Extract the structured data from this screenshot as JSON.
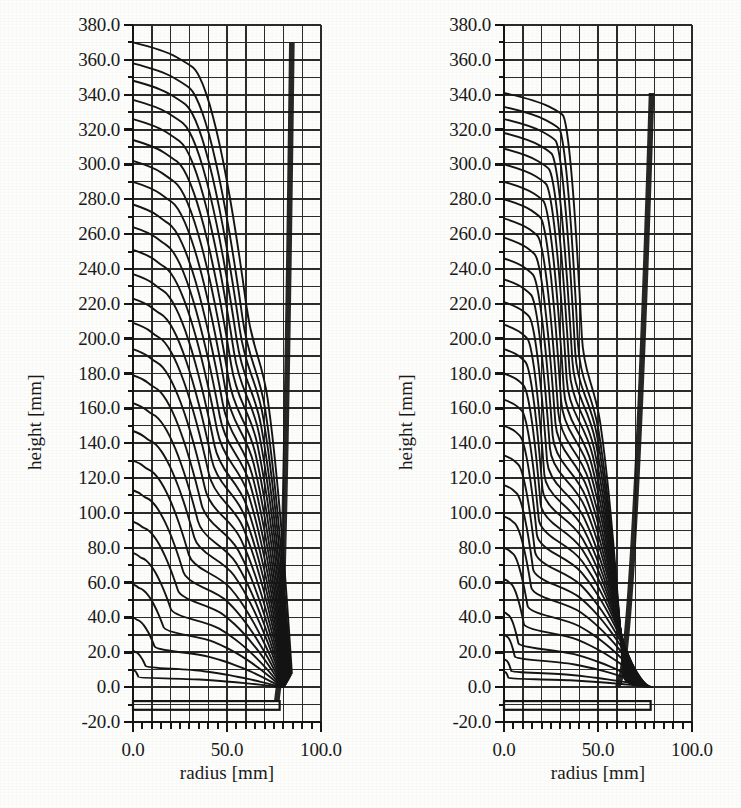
{
  "figure": {
    "background_color": "#fdfdfc",
    "ink_color": "#151515",
    "grid_color": "#2b2b2b",
    "panel_count": 2
  },
  "chart_data": [
    {
      "type": "line",
      "panel": "left",
      "title": "",
      "xlabel": "radius [mm]",
      "ylabel": "height [mm]",
      "xlim": [
        0.0,
        100.0
      ],
      "ylim": [
        -20.0,
        380.0
      ],
      "grid": true,
      "legend": "none",
      "x_major_ticks": [
        0.0,
        50.0,
        100.0
      ],
      "x_major_tick_labels": [
        "0.0",
        "50.0",
        "100.0"
      ],
      "x_minor_tick_step": 5.0,
      "x_grid_step": 10.0,
      "y_major_ticks": [
        -20.0,
        0.0,
        20.0,
        40.0,
        60.0,
        80.0,
        100.0,
        120.0,
        140.0,
        160.0,
        180.0,
        200.0,
        220.0,
        240.0,
        260.0,
        280.0,
        300.0,
        320.0,
        340.0,
        360.0,
        380.0
      ],
      "y_major_tick_labels": [
        "-20.0",
        "0.0",
        "20.0",
        "40.0",
        "60.0",
        "80.0",
        "100.0",
        "120.0",
        "140.0",
        "160.0",
        "180.0",
        "200.0",
        "220.0",
        "240.0",
        "260.0",
        "280.0",
        "300.0",
        "320.0",
        "340.0",
        "360.0",
        "380.0"
      ],
      "y_minor_tick_step": 10.0,
      "y_grid_step": 10.0,
      "description": "Axisymmetric FEM mesh of a deep-drawn cup: nested material flow lines rising from the blank at height -13 mm up to a drawn height of about 370 mm, all converging into a dark wall band near radius 78-85 mm.",
      "blank_outline": {
        "r0": 0.0,
        "r1": 78.0,
        "y_top": -8.0,
        "y_bottom": -13.0
      },
      "wall_band": {
        "r_inner": 78.0,
        "r_outer": 86.0,
        "y_bottom": -8.0,
        "y_top": 300.0
      },
      "series": [
        {
          "name": "flowline-01",
          "apex_height": 370.0,
          "flat_radius": 30.0,
          "knee_radius": 62.0,
          "wall_radius": 84.5,
          "base_height": 8.0
        },
        {
          "name": "flowline-02",
          "apex_height": 358.0,
          "flat_radius": 28.0,
          "knee_radius": 60.0,
          "wall_radius": 84.0,
          "base_height": 7.0
        },
        {
          "name": "flowline-03",
          "apex_height": 348.0,
          "flat_radius": 26.0,
          "knee_radius": 58.5,
          "wall_radius": 83.6,
          "base_height": 6.2
        },
        {
          "name": "flowline-04",
          "apex_height": 337.0,
          "flat_radius": 24.5,
          "knee_radius": 57.0,
          "wall_radius": 83.2,
          "base_height": 5.5
        },
        {
          "name": "flowline-05",
          "apex_height": 326.0,
          "flat_radius": 23.0,
          "knee_radius": 55.5,
          "wall_radius": 82.9,
          "base_height": 4.8
        },
        {
          "name": "flowline-06",
          "apex_height": 314.0,
          "flat_radius": 21.5,
          "knee_radius": 54.0,
          "wall_radius": 82.6,
          "base_height": 4.2
        },
        {
          "name": "flowline-07",
          "apex_height": 302.0,
          "flat_radius": 20.0,
          "knee_radius": 52.5,
          "wall_radius": 82.3,
          "base_height": 3.7
        },
        {
          "name": "flowline-08",
          "apex_height": 290.0,
          "flat_radius": 18.5,
          "knee_radius": 51.0,
          "wall_radius": 82.0,
          "base_height": 3.2
        },
        {
          "name": "flowline-09",
          "apex_height": 277.0,
          "flat_radius": 17.0,
          "knee_radius": 49.5,
          "wall_radius": 81.8,
          "base_height": 2.8
        },
        {
          "name": "flowline-10",
          "apex_height": 264.0,
          "flat_radius": 16.0,
          "knee_radius": 48.0,
          "wall_radius": 81.6,
          "base_height": 2.4
        },
        {
          "name": "flowline-11",
          "apex_height": 251.0,
          "flat_radius": 15.0,
          "knee_radius": 46.5,
          "wall_radius": 81.4,
          "base_height": 2.0
        },
        {
          "name": "flowline-12",
          "apex_height": 237.0,
          "flat_radius": 14.0,
          "knee_radius": 45.0,
          "wall_radius": 81.2,
          "base_height": 1.7
        },
        {
          "name": "flowline-13",
          "apex_height": 223.0,
          "flat_radius": 13.0,
          "knee_radius": 43.5,
          "wall_radius": 81.0,
          "base_height": 1.4
        },
        {
          "name": "flowline-14",
          "apex_height": 209.0,
          "flat_radius": 12.0,
          "knee_radius": 42.0,
          "wall_radius": 80.8,
          "base_height": 1.1
        },
        {
          "name": "flowline-15",
          "apex_height": 194.0,
          "flat_radius": 11.0,
          "knee_radius": 40.0,
          "wall_radius": 80.6,
          "base_height": 0.9
        },
        {
          "name": "flowline-16",
          "apex_height": 179.0,
          "flat_radius": 10.0,
          "knee_radius": 38.0,
          "wall_radius": 80.4,
          "base_height": 0.7
        },
        {
          "name": "flowline-17",
          "apex_height": 163.0,
          "flat_radius": 9.0,
          "knee_radius": 36.0,
          "wall_radius": 80.2,
          "base_height": 0.5
        },
        {
          "name": "flowline-18",
          "apex_height": 147.0,
          "flat_radius": 8.0,
          "knee_radius": 34.0,
          "wall_radius": 80.0,
          "base_height": 0.4
        },
        {
          "name": "flowline-19",
          "apex_height": 130.0,
          "flat_radius": 7.0,
          "knee_radius": 31.0,
          "wall_radius": 79.8,
          "base_height": 0.3
        },
        {
          "name": "flowline-20",
          "apex_height": 113.0,
          "flat_radius": 6.0,
          "knee_radius": 28.0,
          "wall_radius": 79.6,
          "base_height": 0.2
        },
        {
          "name": "flowline-21",
          "apex_height": 95.0,
          "flat_radius": 5.0,
          "knee_radius": 25.0,
          "wall_radius": 79.4,
          "base_height": 0.2
        },
        {
          "name": "flowline-22",
          "apex_height": 77.0,
          "flat_radius": 4.0,
          "knee_radius": 21.0,
          "wall_radius": 79.2,
          "base_height": 0.1
        },
        {
          "name": "flowline-23",
          "apex_height": 59.0,
          "flat_radius": 3.0,
          "knee_radius": 17.0,
          "wall_radius": 79.0,
          "base_height": 0.1
        },
        {
          "name": "flowline-24",
          "apex_height": 40.0,
          "flat_radius": 2.0,
          "knee_radius": 12.0,
          "wall_radius": 78.8,
          "base_height": 0.0
        },
        {
          "name": "flowline-25",
          "apex_height": 21.0,
          "flat_radius": 1.0,
          "knee_radius": 7.0,
          "wall_radius": 78.6,
          "base_height": 0.0
        },
        {
          "name": "flowline-26",
          "apex_height": 10.0,
          "flat_radius": 0.5,
          "knee_radius": 3.0,
          "wall_radius": 78.4,
          "base_height": 0.0
        }
      ]
    },
    {
      "type": "line",
      "panel": "right",
      "title": "",
      "xlabel": "radius [mm]",
      "ylabel": "height [mm]",
      "xlim": [
        0.0,
        100.0
      ],
      "ylim": [
        -20.0,
        380.0
      ],
      "grid": true,
      "legend": "none",
      "x_major_ticks": [
        0.0,
        50.0,
        100.0
      ],
      "x_major_tick_labels": [
        "0.0",
        "50.0",
        "100.0"
      ],
      "x_minor_tick_step": 5.0,
      "x_grid_step": 10.0,
      "y_major_ticks": [
        -20.0,
        0.0,
        20.0,
        40.0,
        60.0,
        80.0,
        100.0,
        120.0,
        140.0,
        160.0,
        180.0,
        200.0,
        220.0,
        240.0,
        260.0,
        280.0,
        300.0,
        320.0,
        340.0,
        360.0,
        380.0
      ],
      "y_major_tick_labels": [
        "-20.0",
        "0.0",
        "20.0",
        "40.0",
        "60.0",
        "80.0",
        "100.0",
        "120.0",
        "140.0",
        "160.0",
        "180.0",
        "200.0",
        "220.0",
        "240.0",
        "260.0",
        "280.0",
        "300.0",
        "320.0",
        "340.0",
        "360.0",
        "380.0"
      ],
      "y_minor_tick_step": 10.0,
      "y_grid_step": 10.0,
      "description": "Second simulation variant: flat-topped flow lines reaching only about 341 mm, with a long straight shoulder out to radius 30 mm and a sharp knee that collapses into a narrow dark wall band near radius 62-80 mm.",
      "blank_outline": {
        "r0": 0.0,
        "r1": 78.0,
        "y_top": -8.0,
        "y_bottom": -13.0
      },
      "wall_band": {
        "r_inner": 62.0,
        "r_outer": 80.0,
        "y_bottom": 0.0,
        "y_top": 300.0
      },
      "series": [
        {
          "name": "flowline-01",
          "apex_height": 341.0,
          "flat_radius": 31.0,
          "knee_radius": 42.0,
          "wall_radius": 63.5,
          "base_height": 6.0
        },
        {
          "name": "flowline-02",
          "apex_height": 333.0,
          "flat_radius": 29.0,
          "knee_radius": 40.0,
          "wall_radius": 63.8,
          "base_height": 5.4
        },
        {
          "name": "flowline-03",
          "apex_height": 326.0,
          "flat_radius": 27.0,
          "knee_radius": 38.5,
          "wall_radius": 64.1,
          "base_height": 4.9
        },
        {
          "name": "flowline-04",
          "apex_height": 318.0,
          "flat_radius": 25.0,
          "knee_radius": 37.0,
          "wall_radius": 64.4,
          "base_height": 4.4
        },
        {
          "name": "flowline-05",
          "apex_height": 309.0,
          "flat_radius": 23.5,
          "knee_radius": 35.5,
          "wall_radius": 64.7,
          "base_height": 4.0
        },
        {
          "name": "flowline-06",
          "apex_height": 300.0,
          "flat_radius": 22.0,
          "knee_radius": 34.0,
          "wall_radius": 65.0,
          "base_height": 3.6
        },
        {
          "name": "flowline-07",
          "apex_height": 290.0,
          "flat_radius": 20.5,
          "knee_radius": 32.5,
          "wall_radius": 65.4,
          "base_height": 3.2
        },
        {
          "name": "flowline-08",
          "apex_height": 280.0,
          "flat_radius": 19.0,
          "knee_radius": 31.0,
          "wall_radius": 65.8,
          "base_height": 2.9
        },
        {
          "name": "flowline-09",
          "apex_height": 269.0,
          "flat_radius": 17.5,
          "knee_radius": 29.5,
          "wall_radius": 66.2,
          "base_height": 2.6
        },
        {
          "name": "flowline-10",
          "apex_height": 258.0,
          "flat_radius": 16.0,
          "knee_radius": 28.0,
          "wall_radius": 66.7,
          "base_height": 2.3
        },
        {
          "name": "flowline-11",
          "apex_height": 246.0,
          "flat_radius": 15.0,
          "knee_radius": 26.5,
          "wall_radius": 67.2,
          "base_height": 2.0
        },
        {
          "name": "flowline-12",
          "apex_height": 234.0,
          "flat_radius": 14.0,
          "knee_radius": 25.0,
          "wall_radius": 67.8,
          "base_height": 1.8
        },
        {
          "name": "flowline-13",
          "apex_height": 221.0,
          "flat_radius": 13.0,
          "knee_radius": 23.5,
          "wall_radius": 68.4,
          "base_height": 1.5
        },
        {
          "name": "flowline-14",
          "apex_height": 208.0,
          "flat_radius": 12.0,
          "knee_radius": 22.0,
          "wall_radius": 69.1,
          "base_height": 1.3
        },
        {
          "name": "flowline-15",
          "apex_height": 194.0,
          "flat_radius": 11.0,
          "knee_radius": 21.0,
          "wall_radius": 69.9,
          "base_height": 1.1
        },
        {
          "name": "flowline-16",
          "apex_height": 180.0,
          "flat_radius": 10.0,
          "knee_radius": 20.0,
          "wall_radius": 70.8,
          "base_height": 0.9
        },
        {
          "name": "flowline-17",
          "apex_height": 165.0,
          "flat_radius": 9.0,
          "knee_radius": 19.0,
          "wall_radius": 71.8,
          "base_height": 0.8
        },
        {
          "name": "flowline-18",
          "apex_height": 150.0,
          "flat_radius": 8.0,
          "knee_radius": 18.0,
          "wall_radius": 72.8,
          "base_height": 0.6
        },
        {
          "name": "flowline-19",
          "apex_height": 133.0,
          "flat_radius": 7.0,
          "knee_radius": 17.0,
          "wall_radius": 73.8,
          "base_height": 0.5
        },
        {
          "name": "flowline-20",
          "apex_height": 116.0,
          "flat_radius": 6.0,
          "knee_radius": 16.0,
          "wall_radius": 74.8,
          "base_height": 0.4
        },
        {
          "name": "flowline-21",
          "apex_height": 98.0,
          "flat_radius": 5.0,
          "knee_radius": 15.0,
          "wall_radius": 75.7,
          "base_height": 0.3
        },
        {
          "name": "flowline-22",
          "apex_height": 80.0,
          "flat_radius": 4.0,
          "knee_radius": 13.0,
          "wall_radius": 76.5,
          "base_height": 0.2
        },
        {
          "name": "flowline-23",
          "apex_height": 62.0,
          "flat_radius": 3.0,
          "knee_radius": 11.0,
          "wall_radius": 77.2,
          "base_height": 0.2
        },
        {
          "name": "flowline-24",
          "apex_height": 43.0,
          "flat_radius": 2.0,
          "knee_radius": 8.0,
          "wall_radius": 77.8,
          "base_height": 0.1
        },
        {
          "name": "flowline-25",
          "apex_height": 30.0,
          "flat_radius": 1.5,
          "knee_radius": 6.0,
          "wall_radius": 78.2,
          "base_height": 0.1
        },
        {
          "name": "flowline-26",
          "apex_height": 16.0,
          "flat_radius": 1.0,
          "knee_radius": 4.0,
          "wall_radius": 78.5,
          "base_height": 0.0
        },
        {
          "name": "flowline-27",
          "apex_height": 9.0,
          "flat_radius": 0.5,
          "knee_radius": 2.5,
          "wall_radius": 78.8,
          "base_height": 0.0
        }
      ]
    }
  ]
}
